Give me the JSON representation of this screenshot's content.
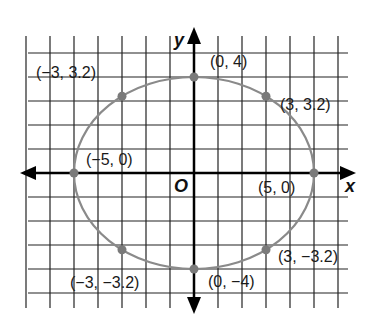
{
  "chart_data": {
    "type": "scatter",
    "title": "",
    "xlabel": "x",
    "ylabel": "y",
    "origin_label": "O",
    "grid": true,
    "xlim": [
      -7,
      6
    ],
    "ylim": [
      -5,
      5
    ],
    "curve": {
      "shape": "ellipse",
      "center": [
        0,
        0
      ],
      "semi_major_x": 5,
      "semi_minor_y": 4,
      "color": "#8a8a8a"
    },
    "points": [
      {
        "x": -3,
        "y": 3.2,
        "label": "(−3, 3.2)"
      },
      {
        "x": 0,
        "y": 4,
        "label": "(0, 4)"
      },
      {
        "x": 3,
        "y": 3.2,
        "label": "(3, 3.2)"
      },
      {
        "x": -5,
        "y": 0,
        "label": "(−5, 0)"
      },
      {
        "x": 5,
        "y": 0,
        "label": "(5, 0)"
      },
      {
        "x": -3,
        "y": -3.2,
        "label": "(−3, −3.2)"
      },
      {
        "x": 0,
        "y": -4,
        "label": "(0, −4)"
      },
      {
        "x": 3,
        "y": -3.2,
        "label": "(3, −3.2)"
      }
    ],
    "point_color": "#7a7a7a"
  }
}
